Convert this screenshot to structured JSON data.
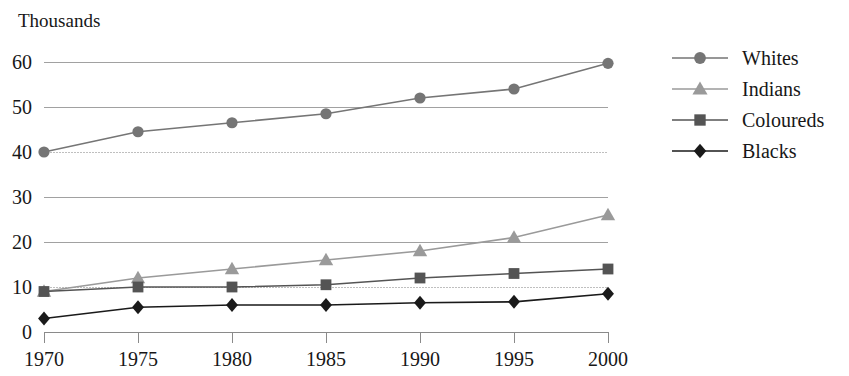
{
  "chart_data": {
    "type": "line",
    "title": "Thousands",
    "xlabel": "",
    "ylabel": "",
    "x": [
      1970,
      1975,
      1980,
      1985,
      1990,
      1995,
      2000
    ],
    "categories": [
      "1970",
      "1975",
      "1980",
      "1985",
      "1990",
      "1995",
      "2000"
    ],
    "ylim": [
      0,
      60
    ],
    "y_ticks": [
      0,
      10,
      20,
      30,
      40,
      50,
      60
    ],
    "y_tick_labels": [
      "0",
      "10",
      "20",
      "30",
      "40",
      "50",
      "60"
    ],
    "grid": true,
    "legend_position": "right",
    "series": [
      {
        "name": "Whites",
        "marker": "circle",
        "color": "#757575",
        "values": [
          40,
          44.5,
          46.5,
          48.5,
          52,
          54,
          59.7
        ]
      },
      {
        "name": "Indians",
        "marker": "triangle",
        "color": "#9a9a9a",
        "values": [
          9,
          12,
          14,
          16,
          18,
          21,
          26
        ]
      },
      {
        "name": "Coloureds",
        "marker": "square",
        "color": "#545454",
        "values": [
          9,
          10,
          10,
          10.5,
          12,
          13,
          14
        ]
      },
      {
        "name": "Blacks",
        "marker": "diamond",
        "color": "#1a1a1a",
        "values": [
          3,
          5.5,
          6,
          6,
          6.5,
          6.7,
          8.5
        ]
      }
    ]
  },
  "legend": {
    "items": [
      {
        "label": "Whites"
      },
      {
        "label": "Indians"
      },
      {
        "label": "Coloureds"
      },
      {
        "label": "Blacks"
      }
    ]
  },
  "colors": {
    "gridline": "#8a8a8a",
    "axis": "#8a8a8a",
    "background": "#ffffff",
    "text": "#171717"
  }
}
